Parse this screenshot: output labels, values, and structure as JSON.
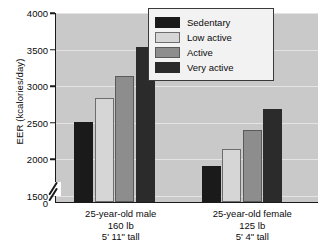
{
  "chart_data": {
    "type": "bar",
    "title": "",
    "xlabel": "",
    "ylabel": "EER (kcalories/day)",
    "ylim": [
      1400,
      4000
    ],
    "y_axis_break": true,
    "y_break_note": "axis broken between 0 and 1500",
    "yticks": [
      0,
      1500,
      2000,
      2500,
      3000,
      3500,
      4000
    ],
    "ytick_labels": [
      "0",
      "1500",
      "2000",
      "2500",
      "3000",
      "3500",
      "4000"
    ],
    "grid": true,
    "legend_position": "top-right",
    "categories": [
      "25-year-old male\n160 lb\n5' 11\" tall",
      "25-year-old female\n125 lb\n5' 4\" tall"
    ],
    "category_lines": [
      [
        "25-year-old male",
        "160 lb",
        "5' 11\" tall"
      ],
      [
        "25-year-old female",
        "125 lb",
        "5' 4\" tall"
      ]
    ],
    "series": [
      {
        "name": "Sedentary",
        "color": "#1a1a1a",
        "values": [
          2490,
          1890
        ]
      },
      {
        "name": "Low active",
        "color": "#d6d6d6",
        "values": [
          2820,
          2130
        ]
      },
      {
        "name": "Active",
        "color": "#8d8d8d",
        "values": [
          3120,
          2390
        ]
      },
      {
        "name": "Very active",
        "color": "#2b2b2b",
        "values": [
          3520,
          2670
        ]
      }
    ],
    "plot_background": "#c9c9c9",
    "gridline_color": "#e4e4e4",
    "axis_color": "#1a1a1a"
  },
  "legend": {
    "items": [
      {
        "label": "Sedentary"
      },
      {
        "label": "Low active"
      },
      {
        "label": "Active"
      },
      {
        "label": "Very active"
      }
    ]
  }
}
